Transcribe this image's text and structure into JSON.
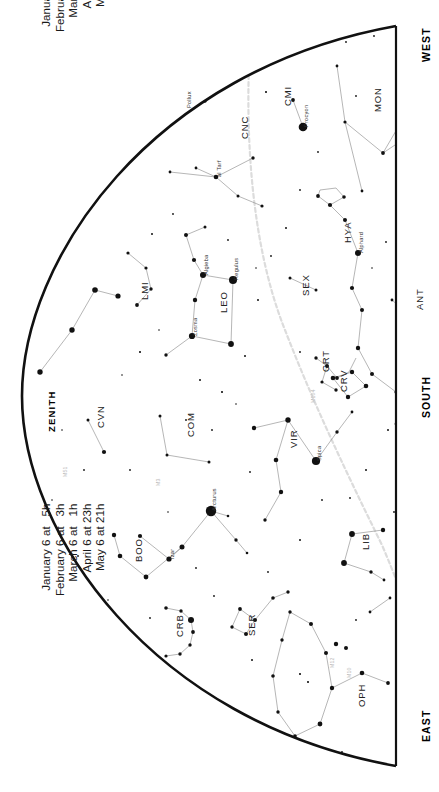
{
  "chart_data": {
    "type": "scatter",
    "title": "",
    "subtitle": "",
    "xlabel": "",
    "ylabel": "",
    "grid": false,
    "legend_position": "none",
    "projection": "half-dome sky map, south-facing horizon view",
    "directions": [
      {
        "name": "west-label",
        "text": "WEST",
        "x": 420,
        "y": 62
      },
      {
        "name": "south-label",
        "text": "SOUTH",
        "x": 420,
        "y": 418
      },
      {
        "name": "east-label",
        "text": "EAST",
        "x": 420,
        "y": 742
      },
      {
        "name": "zenith-label",
        "text": "ZENITH",
        "x": 46,
        "y": 432
      }
    ],
    "time_blocks": [
      {
        "name": "upper-time-block",
        "x": 40,
        "y": 32,
        "lines": [
          "January 21 at   4h",
          "February 21 at   2h",
          "March 21 at   0h",
          "April 21 at 22h",
          "May 21 at 20h"
        ]
      },
      {
        "name": "lower-time-block",
        "x": 40,
        "y": 596,
        "lines": [
          "January 6 at   5h",
          "February 6 at   3h",
          "March 6 at   1h",
          "April 6 at 23h",
          "May 6 at 21h"
        ]
      }
    ],
    "constellations": [
      {
        "abbr": "CNC",
        "name": "Cancer",
        "x": 239,
        "y": 139
      },
      {
        "abbr": "CMI",
        "name": "Canis Minor",
        "x": 282,
        "y": 106
      },
      {
        "abbr": "MON",
        "name": "Monoceros",
        "x": 372,
        "y": 112
      },
      {
        "abbr": "HYA",
        "name": "Hydra",
        "x": 342,
        "y": 243
      },
      {
        "abbr": "LEO",
        "name": "Leo",
        "x": 218,
        "y": 313
      },
      {
        "abbr": "LMI",
        "name": "Leo Minor",
        "x": 139,
        "y": 300
      },
      {
        "abbr": "SEX",
        "name": "Sextans",
        "x": 300,
        "y": 296
      },
      {
        "abbr": "CRT",
        "name": "Crater",
        "x": 320,
        "y": 372
      },
      {
        "abbr": "CRV",
        "name": "Corvus",
        "x": 338,
        "y": 392
      },
      {
        "abbr": "ANT",
        "name": "Antlia",
        "x": 414,
        "y": 310
      },
      {
        "abbr": "CVN",
        "name": "Canes Venatici",
        "x": 95,
        "y": 428
      },
      {
        "abbr": "COM",
        "name": "Coma Berenices",
        "x": 185,
        "y": 437
      },
      {
        "abbr": "VIR",
        "name": "Virgo",
        "x": 288,
        "y": 448
      },
      {
        "abbr": "BOO",
        "name": "Bootes",
        "x": 133,
        "y": 562
      },
      {
        "abbr": "CRB",
        "name": "Corona Borealis",
        "x": 174,
        "y": 637
      },
      {
        "abbr": "SER",
        "name": "Serpens",
        "x": 246,
        "y": 636
      },
      {
        "abbr": "LIB",
        "name": "Libra",
        "x": 360,
        "y": 550
      },
      {
        "abbr": "OPH",
        "name": "Ophiuchus",
        "x": 356,
        "y": 707
      }
    ],
    "named_stars": [
      {
        "label": "Pollux",
        "x": 186,
        "y": 108,
        "mag": 1.1
      },
      {
        "label": "Procyon",
        "x": 303,
        "y": 127,
        "mag": 0.4
      },
      {
        "label": "Alphard",
        "x": 358,
        "y": 253,
        "mag": 2.0
      },
      {
        "label": "Regulus",
        "x": 233,
        "y": 280,
        "mag": 1.4
      },
      {
        "label": "Algieba",
        "x": 203,
        "y": 275,
        "mag": 2.2
      },
      {
        "label": "Zosma",
        "x": 192,
        "y": 336,
        "mag": 2.5
      },
      {
        "label": "al Tarf",
        "x": 216,
        "y": 177,
        "mag": 3.5
      },
      {
        "label": "Spica",
        "x": 316,
        "y": 461,
        "mag": 1.0
      },
      {
        "label": "Arcturus",
        "x": 211,
        "y": 511,
        "mag": 0.0
      },
      {
        "label": "Izar",
        "x": 169,
        "y": 559,
        "mag": 2.4
      }
    ],
    "deep_sky_objects": [
      {
        "label": "M51",
        "x": 62,
        "y": 477
      },
      {
        "label": "M3",
        "x": 155,
        "y": 486
      },
      {
        "label": "M104",
        "x": 310,
        "y": 403
      },
      {
        "label": "M12",
        "x": 329,
        "y": 668
      },
      {
        "label": "M10",
        "x": 346,
        "y": 678
      }
    ],
    "ecliptic": {
      "visible": true,
      "style": "dashed",
      "color": "#d8d8d8"
    },
    "horizon": {
      "style": "solid",
      "color": "#111111",
      "width": 2.6
    }
  }
}
